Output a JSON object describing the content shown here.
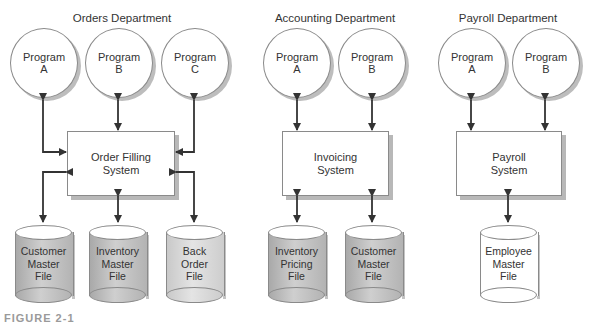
{
  "departments": [
    {
      "title": "Orders Department",
      "programs": [
        {
          "line1": "Program",
          "line2": "A"
        },
        {
          "line1": "Program",
          "line2": "B"
        },
        {
          "line1": "Program",
          "line2": "C"
        }
      ],
      "system": {
        "line1": "Order Filling",
        "line2": "System"
      },
      "files": [
        {
          "line1": "Customer",
          "line2": "Master",
          "line3": "File",
          "shade": "dark"
        },
        {
          "line1": "Inventory",
          "line2": "Master",
          "line3": "File",
          "shade": "dark"
        },
        {
          "line1": "Back",
          "line2": "Order",
          "line3": "File",
          "shade": "light"
        }
      ]
    },
    {
      "title": "Accounting Department",
      "programs": [
        {
          "line1": "Program",
          "line2": "A"
        },
        {
          "line1": "Program",
          "line2": "B"
        }
      ],
      "system": {
        "line1": "Invoicing",
        "line2": "System"
      },
      "files": [
        {
          "line1": "Inventory",
          "line2": "Pricing",
          "line3": "File",
          "shade": "dark"
        },
        {
          "line1": "Customer",
          "line2": "Master",
          "line3": "File",
          "shade": "dark"
        }
      ]
    },
    {
      "title": "Payroll Department",
      "programs": [
        {
          "line1": "Program",
          "line2": "A"
        },
        {
          "line1": "Program",
          "line2": "B"
        }
      ],
      "system": {
        "line1": "Payroll",
        "line2": "System"
      },
      "files": [
        {
          "line1": "Employee",
          "line2": "Master",
          "line3": "File",
          "shade": "white"
        }
      ]
    }
  ],
  "caption": "FIGURE 2-1",
  "colors": {
    "line": "#333333",
    "outline": "#8a8a8a",
    "shadow": "#bdbdbd",
    "cylinder_dark": "#b8b8b8",
    "cylinder_light": "#d8d8d8"
  }
}
